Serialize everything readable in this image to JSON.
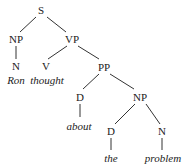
{
  "tree": {
    "nodes": [
      {
        "id": "S",
        "label": "S",
        "x": 41,
        "y": 10,
        "type": "category"
      },
      {
        "id": "NP1",
        "label": "NP",
        "x": 16,
        "y": 39,
        "type": "category"
      },
      {
        "id": "VP",
        "label": "VP",
        "x": 72,
        "y": 39,
        "type": "category"
      },
      {
        "id": "N1",
        "label": "N",
        "x": 16,
        "y": 66,
        "type": "category"
      },
      {
        "id": "V",
        "label": "V",
        "x": 46,
        "y": 66,
        "type": "category"
      },
      {
        "id": "PP",
        "label": "PP",
        "x": 104,
        "y": 67,
        "type": "category"
      },
      {
        "id": "w_ron",
        "label": "Ron",
        "x": 16,
        "y": 80,
        "type": "word"
      },
      {
        "id": "w_thought",
        "label": "thought",
        "x": 47,
        "y": 80,
        "type": "word"
      },
      {
        "id": "D1",
        "label": "D",
        "x": 80,
        "y": 97,
        "type": "category"
      },
      {
        "id": "NP2",
        "label": "NP",
        "x": 140,
        "y": 97,
        "type": "category"
      },
      {
        "id": "w_about",
        "label": "about",
        "x": 79,
        "y": 126,
        "type": "word"
      },
      {
        "id": "D2",
        "label": "D",
        "x": 111,
        "y": 131,
        "type": "category"
      },
      {
        "id": "N2",
        "label": "N",
        "x": 162,
        "y": 131,
        "type": "category"
      },
      {
        "id": "w_the",
        "label": "the",
        "x": 111,
        "y": 158,
        "type": "word"
      },
      {
        "id": "w_problem",
        "label": "problem",
        "x": 163,
        "y": 158,
        "type": "word"
      }
    ],
    "edges": [
      {
        "from": "S",
        "to": "NP1",
        "x1": 36,
        "y1": 17,
        "x2": 20,
        "y2": 32
      },
      {
        "from": "S",
        "to": "VP",
        "x1": 47,
        "y1": 17,
        "x2": 66,
        "y2": 32
      },
      {
        "from": "NP1",
        "to": "N1",
        "x1": 16,
        "y1": 46,
        "x2": 16,
        "y2": 59
      },
      {
        "from": "VP",
        "to": "V",
        "x1": 67,
        "y1": 46,
        "x2": 48,
        "y2": 59
      },
      {
        "from": "VP",
        "to": "PP",
        "x1": 78,
        "y1": 46,
        "x2": 99,
        "y2": 59
      },
      {
        "from": "PP",
        "to": "D1",
        "x1": 99,
        "y1": 74,
        "x2": 83,
        "y2": 89
      },
      {
        "from": "PP",
        "to": "NP2",
        "x1": 110,
        "y1": 74,
        "x2": 134,
        "y2": 89
      },
      {
        "from": "D1",
        "to": "about",
        "x1": 80,
        "y1": 104,
        "x2": 80,
        "y2": 117
      },
      {
        "from": "NP2",
        "to": "D2",
        "x1": 135,
        "y1": 104,
        "x2": 115,
        "y2": 124
      },
      {
        "from": "NP2",
        "to": "N2",
        "x1": 146,
        "y1": 104,
        "x2": 160,
        "y2": 124
      },
      {
        "from": "D2",
        "to": "the",
        "x1": 111,
        "y1": 138,
        "x2": 111,
        "y2": 150
      },
      {
        "from": "N2",
        "to": "problem",
        "x1": 162,
        "y1": 138,
        "x2": 162,
        "y2": 150
      }
    ]
  }
}
